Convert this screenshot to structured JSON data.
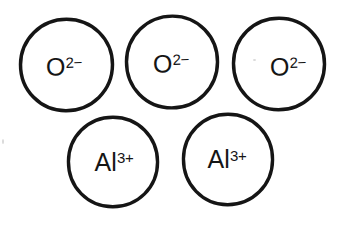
{
  "diagram": {
    "background_color": "#ffffff",
    "stroke_color": "#151515",
    "text_color": "#151515",
    "width": 344,
    "height": 235,
    "rows": [
      {
        "name": "anion-row",
        "label": "oxide ions"
      },
      {
        "name": "cation-row",
        "label": "aluminium ions"
      }
    ],
    "ions": [
      {
        "id": "ion-0",
        "species": "oxide",
        "symbol": "O",
        "charge": "2−",
        "full_label": "O2−",
        "row": 0,
        "index_in_row": 0
      },
      {
        "id": "ion-1",
        "species": "oxide",
        "symbol": "O",
        "charge": "2−",
        "full_label": "O2−",
        "row": 0,
        "index_in_row": 1
      },
      {
        "id": "ion-2",
        "species": "oxide",
        "symbol": "O",
        "charge": "2−",
        "full_label": "O2−",
        "row": 0,
        "index_in_row": 2
      },
      {
        "id": "ion-3",
        "species": "aluminium",
        "symbol": "Al",
        "charge": "3+",
        "full_label": "Al3+",
        "row": 1,
        "index_in_row": 0
      },
      {
        "id": "ion-4",
        "species": "aluminium",
        "symbol": "Al",
        "charge": "3+",
        "full_label": "Al3+",
        "row": 1,
        "index_in_row": 1
      }
    ]
  }
}
